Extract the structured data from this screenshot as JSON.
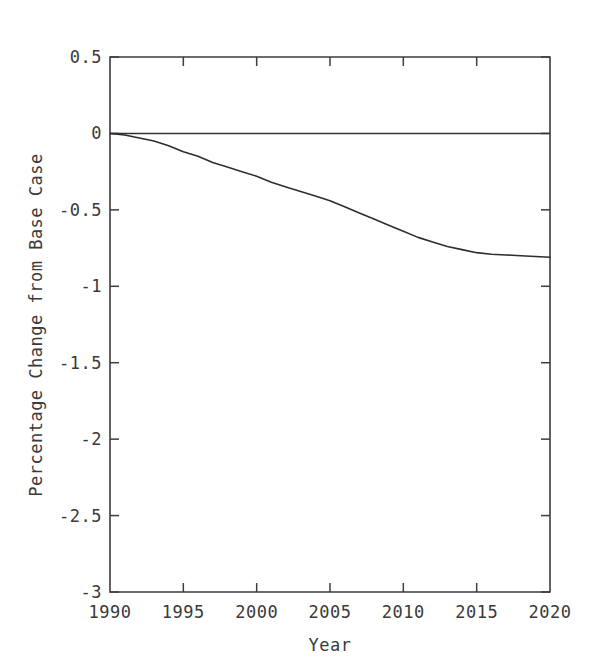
{
  "chart_data": {
    "type": "line",
    "title": "",
    "subtitle": "",
    "xlabel": "Year",
    "ylabel": "Percentage Change from Base Case",
    "xlim": [
      1990,
      2020
    ],
    "ylim": [
      -3,
      0.5
    ],
    "grid": false,
    "legend": "none",
    "xticks": [
      "1990",
      "1995",
      "2000",
      "2005",
      "2010",
      "2015",
      "2020"
    ],
    "xtick_values": [
      1990,
      1995,
      2000,
      2005,
      2010,
      2015,
      2020
    ],
    "yticks": [
      "0.5",
      "0",
      "-0.5",
      "-1",
      "-1.5",
      "-2",
      "-2.5",
      "-3"
    ],
    "ytick_values": [
      0.5,
      0,
      -0.5,
      -1,
      -1.5,
      -2,
      -2.5,
      -3
    ],
    "x": [
      1990,
      1991,
      1992,
      1993,
      1994,
      1995,
      1996,
      1997,
      1998,
      1999,
      2000,
      2001,
      2002,
      2003,
      2004,
      2005,
      2006,
      2007,
      2008,
      2009,
      2010,
      2011,
      2012,
      2013,
      2014,
      2015,
      2016,
      2017,
      2018,
      2019,
      2020
    ],
    "series": [
      {
        "name": "Zero reference",
        "style": "solid",
        "values": [
          0,
          0,
          0,
          0,
          0,
          0,
          0,
          0,
          0,
          0,
          0,
          0,
          0,
          0,
          0,
          0,
          0,
          0,
          0,
          0,
          0,
          0,
          0,
          0,
          0,
          0,
          0,
          0,
          0,
          0,
          0
        ]
      },
      {
        "name": "Percentage change from base case",
        "style": "solid",
        "values": [
          0.0,
          -0.01,
          -0.03,
          -0.05,
          -0.08,
          -0.12,
          -0.15,
          -0.19,
          -0.22,
          -0.25,
          -0.28,
          -0.32,
          -0.35,
          -0.38,
          -0.41,
          -0.44,
          -0.48,
          -0.52,
          -0.56,
          -0.6,
          -0.64,
          -0.68,
          -0.71,
          -0.74,
          -0.76,
          -0.78,
          -0.79,
          -0.795,
          -0.8,
          -0.805,
          -0.81
        ]
      }
    ]
  },
  "axes": {
    "x_axis_label": "Year",
    "y_axis_label": "Percentage Change from Base Case"
  }
}
